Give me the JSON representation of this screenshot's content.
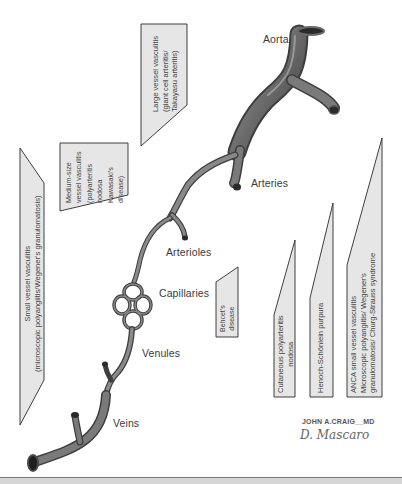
{
  "vessels": {
    "aorta": "Aorta",
    "arteries": "Arteries",
    "arterioles": "Arterioles",
    "capillaries": "Capillaries",
    "venules": "Venules",
    "veins": "Veins"
  },
  "boxes": {
    "large": {
      "lines": [
        "Large vessel vasculitis",
        "(giant cell arteritis/",
        "Takayasu arteritis)"
      ]
    },
    "medium": {
      "lines": [
        "Medium-size",
        "vessel vasculitis",
        "(polyarteritis",
        "nodosa",
        "Kawasaki's",
        "disease)"
      ]
    },
    "small": {
      "lines": [
        "Small vessel vasculitis",
        "(microscopic polyangiitis/Wegener's granulomatosis)"
      ]
    },
    "behcet": {
      "lines": [
        "Behcet's",
        "disease"
      ]
    },
    "cutaneous": {
      "lines": [
        "Cutaneous polyarteritis",
        "nodosa"
      ]
    },
    "henoch": {
      "lines": [
        "Henoch-Schönlein purpura"
      ]
    },
    "anca": {
      "lines": [
        "ANCA small vessel vasculitis",
        "Microscopic polyangiitis/ Wegener's",
        "granulomatosis/ Churg-Strauss syndrome"
      ]
    }
  },
  "signatures": {
    "artist1": "JOHN A.CRAIG__MD",
    "artist2": "D. Mascaro"
  },
  "colors": {
    "box_fill": "#e6e6e6",
    "box_stroke": "#2a2a2a",
    "vessel_dark": "#4a4a4a",
    "vessel_mid": "#7a7a7a",
    "vessel_light": "#b8b8b8"
  }
}
